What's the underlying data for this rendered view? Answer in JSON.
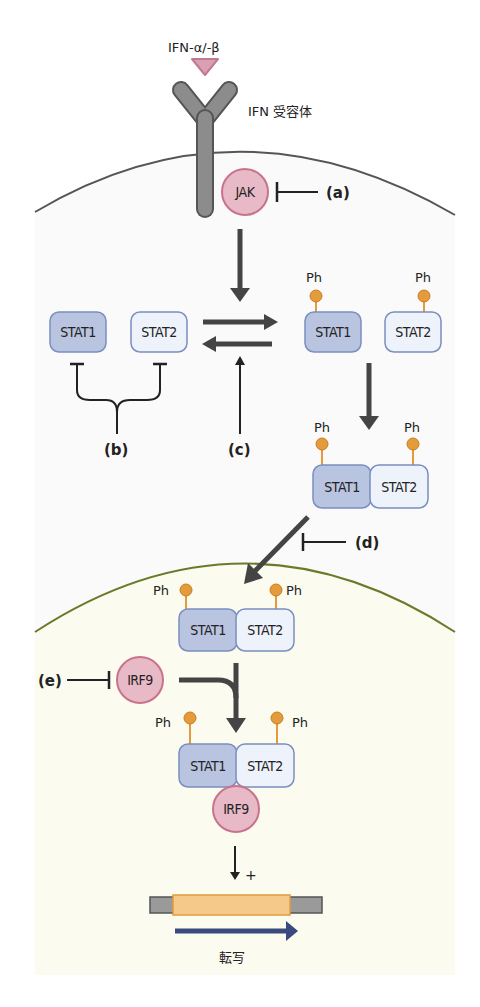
{
  "diagram": {
    "ligand": {
      "label": "IFN-α/-β",
      "color": "#d9a0b2"
    },
    "receptor": {
      "label": "IFN 受容体",
      "color": "#8c8c8c"
    },
    "jak": {
      "label": "JAK",
      "fill": "#e8b9c6",
      "stroke": "#c8738c"
    },
    "irf9": {
      "label": "IRF9",
      "fill": "#e8b9c6",
      "stroke": "#c8738c"
    },
    "stat1": {
      "label": "STAT1",
      "fill": "#b8c4e0",
      "stroke": "#7a8fbf"
    },
    "stat2": {
      "label": "STAT2",
      "fill": "#eef2fb",
      "stroke": "#7a8fbf"
    },
    "phospho": {
      "label": "Ph",
      "color": "#e49b3c"
    },
    "inhibitors": {
      "a": "(a)",
      "b": "(b)",
      "c": "(c)",
      "d": "(d)",
      "e": "(e)"
    },
    "gene": {
      "label": "転写",
      "activation": "+",
      "body_color": "#f5c98a",
      "flank_color": "#9a9a9a",
      "arrow_color": "#3a4a7e"
    },
    "compartments": {
      "cell_membrane_color": "#555555",
      "nuclear_membrane_color": "#6b7a2a",
      "cytoplasm_fill": "#fafafa",
      "nucleus_fill": "#fbfbf0"
    }
  }
}
